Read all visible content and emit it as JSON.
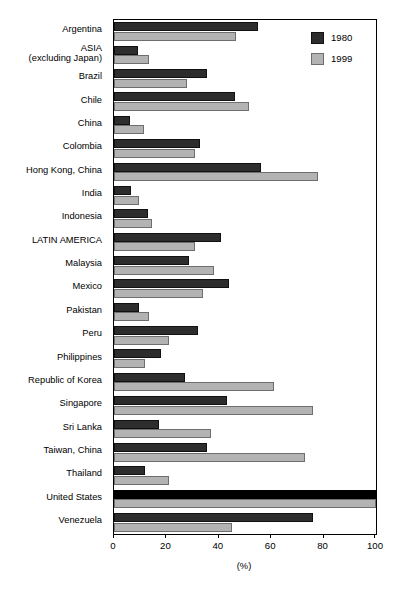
{
  "chart_data": {
    "type": "bar",
    "orientation": "horizontal",
    "title": "",
    "xlabel": "(%)",
    "ylabel": "",
    "xlim": [
      0,
      100
    ],
    "xticks": [
      0,
      20,
      40,
      60,
      80,
      100
    ],
    "grid": false,
    "legend_position": "top-right",
    "categories": [
      "Argentina",
      "ASIA\n(excluding Japan)",
      "Brazil",
      "Chile",
      "China",
      "Colombia",
      "Hong Kong, China",
      "India",
      "Indonesia",
      "LATIN AMERICA",
      "Malaysia",
      "Mexico",
      "Pakistan",
      "Peru",
      "Philippines",
      "Republic of Korea",
      "Singapore",
      "Sri Lanka",
      "Taiwan, China",
      "Thailand",
      "United States",
      "Venezuela"
    ],
    "series": [
      {
        "name": "1980",
        "color": "#2d2d2d",
        "values": [
          55,
          9,
          35.5,
          46,
          6,
          33,
          56,
          6.5,
          13,
          41,
          28.5,
          44,
          9.5,
          32,
          18,
          27,
          43,
          17,
          35.5,
          12,
          100,
          76
        ]
      },
      {
        "name": "1999",
        "color": "#b3b3b3",
        "values": [
          46.5,
          13.5,
          28,
          51.5,
          11.5,
          31,
          78,
          9.5,
          14.5,
          31,
          38,
          34,
          13.5,
          21,
          12,
          61,
          76,
          37,
          73,
          21,
          100,
          45
        ]
      }
    ]
  },
  "legend": {
    "entries": [
      {
        "label": "1980",
        "swatch": "dark-swatch"
      },
      {
        "label": "1999",
        "swatch": "light-swatch"
      }
    ]
  },
  "axis": {
    "tick_labels": [
      "0",
      "20",
      "40",
      "60",
      "80",
      "100"
    ],
    "unit_label": "(%)"
  }
}
